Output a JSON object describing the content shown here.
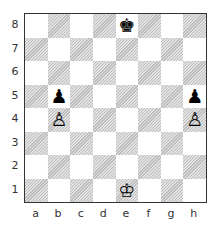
{
  "board": {
    "files": [
      "a",
      "b",
      "c",
      "d",
      "e",
      "f",
      "g",
      "h"
    ],
    "ranks": [
      "8",
      "7",
      "6",
      "5",
      "4",
      "3",
      "2",
      "1"
    ],
    "pieces": [
      {
        "square": "e8",
        "color": "black",
        "type": "king",
        "glyph": "♚"
      },
      {
        "square": "b5",
        "color": "black",
        "type": "pawn",
        "glyph": "♟"
      },
      {
        "square": "h5",
        "color": "black",
        "type": "pawn",
        "glyph": "♟"
      },
      {
        "square": "b4",
        "color": "white",
        "type": "pawn",
        "glyph": "♙"
      },
      {
        "square": "h4",
        "color": "white",
        "type": "pawn",
        "glyph": "♙"
      },
      {
        "square": "e1",
        "color": "white",
        "type": "king",
        "glyph": "♔"
      }
    ],
    "colors": {
      "light": "#ffffff",
      "dark": "#cfcfcf",
      "border": "#333333"
    }
  }
}
